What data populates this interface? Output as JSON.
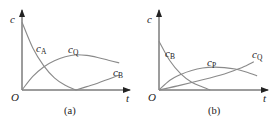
{
  "chart_data": [
    {
      "type": "line",
      "title": "(a)",
      "xlabel": "t",
      "ylabel": "c",
      "origin_label": "O",
      "grid": false,
      "legend": "inline",
      "series": [
        {
          "name": "c_A",
          "symbol": "c",
          "subscript": "A",
          "shape": "decreasing to zero",
          "points": [
            [
              0,
              1.0
            ],
            [
              0.1,
              0.62
            ],
            [
              0.2,
              0.36
            ],
            [
              0.3,
              0.18
            ],
            [
              0.4,
              0.07
            ],
            [
              0.5,
              0.0
            ]
          ]
        },
        {
          "name": "c_Q",
          "symbol": "c",
          "subscript": "Q",
          "shape": "rises to maximum then decreases",
          "points": [
            [
              0,
              0.0
            ],
            [
              0.1,
              0.2
            ],
            [
              0.2,
              0.34
            ],
            [
              0.3,
              0.43
            ],
            [
              0.4,
              0.49
            ],
            [
              0.5,
              0.52
            ],
            [
              0.6,
              0.51
            ],
            [
              0.7,
              0.48
            ],
            [
              0.8,
              0.44
            ],
            [
              0.9,
              0.4
            ]
          ]
        },
        {
          "name": "c_B",
          "symbol": "c",
          "subscript": "B",
          "shape": "zero until c_A depleted, then increases",
          "points": [
            [
              0.5,
              0.0
            ],
            [
              0.6,
              0.05
            ],
            [
              0.7,
              0.1
            ],
            [
              0.8,
              0.16
            ],
            [
              0.9,
              0.22
            ]
          ]
        }
      ],
      "xlim": [
        0,
        1.0
      ],
      "ylim": [
        0,
        1.15
      ]
    },
    {
      "type": "line",
      "title": "(b)",
      "xlabel": "t",
      "ylabel": "c",
      "origin_label": "O",
      "grid": false,
      "legend": "inline",
      "series": [
        {
          "name": "c_B",
          "symbol": "c",
          "subscript": "B",
          "shape": "decreasing to zero",
          "points": [
            [
              0,
              1.0
            ],
            [
              0.1,
              0.6
            ],
            [
              0.2,
              0.33
            ],
            [
              0.3,
              0.16
            ],
            [
              0.4,
              0.06
            ],
            [
              0.47,
              0.0
            ]
          ]
        },
        {
          "name": "c_P",
          "symbol": "c",
          "subscript": "P",
          "shape": "rises to maximum then decreases",
          "points": [
            [
              0,
              0.0
            ],
            [
              0.1,
              0.2
            ],
            [
              0.2,
              0.32
            ],
            [
              0.3,
              0.4
            ],
            [
              0.4,
              0.45
            ],
            [
              0.5,
              0.47
            ],
            [
              0.6,
              0.46
            ],
            [
              0.7,
              0.43
            ],
            [
              0.8,
              0.37
            ],
            [
              0.9,
              0.29
            ]
          ]
        },
        {
          "name": "c_Q",
          "symbol": "c",
          "subscript": "Q",
          "shape": "increases monotonically",
          "points": [
            [
              0,
              0.0
            ],
            [
              0.2,
              0.1
            ],
            [
              0.4,
              0.21
            ],
            [
              0.6,
              0.33
            ],
            [
              0.7,
              0.41
            ],
            [
              0.8,
              0.5
            ],
            [
              0.87,
              0.58
            ]
          ]
        }
      ],
      "xlim": [
        0,
        1.0
      ],
      "ylim": [
        0,
        1.6
      ]
    }
  ]
}
